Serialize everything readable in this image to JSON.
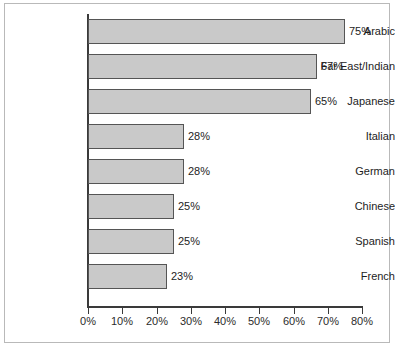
{
  "chart_data": {
    "type": "bar",
    "orientation": "horizontal",
    "title": "",
    "xlabel": "",
    "ylabel": "",
    "xlim": [
      0,
      80
    ],
    "xtick_labels": [
      "0%",
      "10%",
      "20%",
      "30%",
      "40%",
      "50%",
      "60%",
      "70%",
      "80%"
    ],
    "xtick_values": [
      0,
      10,
      20,
      30,
      40,
      50,
      60,
      70,
      80
    ],
    "grid": false,
    "legend": null,
    "categories": [
      "Arabic",
      "Far East/Indian",
      "Japanese",
      "Italian",
      "German",
      "Chinese",
      "Spanish",
      "French"
    ],
    "values": [
      75,
      67,
      65,
      28,
      28,
      25,
      25,
      23
    ],
    "value_labels": [
      "75%",
      "67%",
      "65%",
      "28%",
      "28%",
      "25%",
      "25%",
      "23%"
    ],
    "bar_fill_color": "#C9C9C9",
    "bar_border_color": "#555555",
    "axis_color": "#3A3A3A",
    "frame_color": "#B9B9B9",
    "background_color": "#FFFFFF"
  }
}
